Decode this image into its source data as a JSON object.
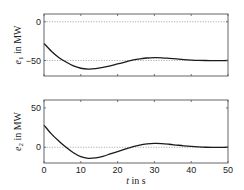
{
  "chart_data": [
    {
      "type": "line",
      "title": "",
      "xlabel": "",
      "ylabel": "e_1 in MW",
      "ylabel_parts": {
        "var": "e",
        "sub": "1",
        "unit": " in MW"
      },
      "xlim": [
        0,
        50
      ],
      "ylim": [
        -70,
        10
      ],
      "xticks": [
        0,
        10,
        20,
        30,
        40,
        50
      ],
      "xtick_labels_visible": false,
      "yticks": [
        -50,
        0
      ],
      "ytick_labels": [
        "−50",
        "0"
      ],
      "reference_lines": [
        0,
        -50
      ],
      "grid": false,
      "legend": null,
      "series": [
        {
          "name": "e1",
          "x": [
            0,
            2,
            4,
            6,
            8,
            10,
            12,
            14,
            16,
            18,
            20,
            22,
            24,
            26,
            28,
            30,
            32,
            34,
            36,
            38,
            40,
            42,
            44,
            46,
            48,
            50
          ],
          "values": [
            -28,
            -38,
            -46,
            -52,
            -57,
            -60,
            -61,
            -60.5,
            -59,
            -57,
            -54.5,
            -52,
            -49.5,
            -48,
            -46.8,
            -46.3,
            -46.5,
            -47.2,
            -48,
            -48.8,
            -49.4,
            -49.8,
            -50,
            -50.1,
            -50.1,
            -50
          ]
        }
      ]
    },
    {
      "type": "line",
      "title": "",
      "xlabel": "t  in s",
      "xlabel_parts": {
        "var": "t",
        "unit": "  in s"
      },
      "ylabel": "e_2 in MW",
      "ylabel_parts": {
        "var": "e",
        "sub": "2",
        "unit": " in MW"
      },
      "xlim": [
        0,
        50
      ],
      "ylim": [
        -20,
        60
      ],
      "xticks": [
        0,
        10,
        20,
        30,
        40,
        50
      ],
      "xtick_labels": [
        "0",
        "10",
        "20",
        "30",
        "40",
        "50"
      ],
      "yticks": [
        0,
        50
      ],
      "ytick_labels": [
        "0",
        "50"
      ],
      "reference_lines": [
        0
      ],
      "grid": false,
      "legend": null,
      "series": [
        {
          "name": "e2",
          "x": [
            0,
            2,
            4,
            6,
            8,
            10,
            12,
            14,
            16,
            18,
            20,
            22,
            24,
            26,
            28,
            30,
            32,
            34,
            36,
            38,
            40,
            42,
            44,
            46,
            48,
            50
          ],
          "values": [
            28,
            17,
            8,
            0,
            -7,
            -12,
            -14,
            -13.5,
            -11.5,
            -8.5,
            -5.5,
            -2.5,
            0.5,
            2.8,
            4.2,
            4.8,
            4.6,
            3.8,
            2.8,
            1.8,
            1,
            0.4,
            0,
            -0.1,
            -0.1,
            0
          ]
        }
      ]
    }
  ],
  "style": {
    "line_color": "#1a1a1a",
    "axes_color": "#555555",
    "ref_line_color": "#9a9a9a"
  }
}
